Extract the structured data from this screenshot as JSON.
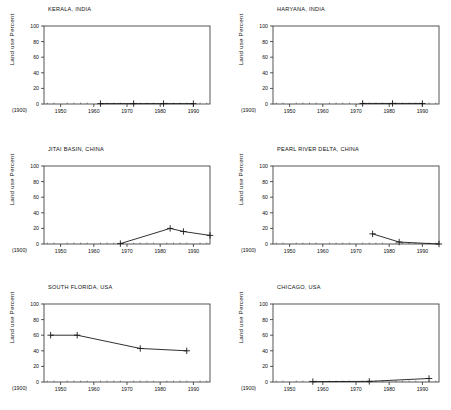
{
  "figure": {
    "layout": "2 columns x 3 rows of small-multiple line charts",
    "background_color": "#ffffff",
    "line_color": "#1a1a1a",
    "marker": "plus"
  },
  "axis": {
    "ylabel": "Land use Percent",
    "yticks": [
      "0",
      "20",
      "40",
      "60",
      "80",
      "100"
    ],
    "ytick_values": [
      0,
      20,
      40,
      60,
      80,
      100
    ],
    "xticks": [
      "1950",
      "1960",
      "1970",
      "1980",
      "1990"
    ],
    "xtick_values": [
      1950,
      1960,
      1970,
      1980,
      1990
    ],
    "origin_note": "(1900)",
    "xlim": [
      1945,
      1995
    ],
    "ylim": [
      0,
      100
    ]
  },
  "chart_data": [
    {
      "type": "line",
      "title": "KERALA, INDIA",
      "xlabel": "",
      "ylabel": "Land use Percent",
      "xlim": [
        1945,
        1995
      ],
      "ylim": [
        0,
        100
      ],
      "grid": false,
      "legend": "none",
      "x": [
        1962,
        1972,
        1981,
        1990
      ],
      "values": [
        0.5,
        0.5,
        0.5,
        0.5
      ]
    },
    {
      "type": "line",
      "title": "HARYANA, INDIA",
      "xlabel": "",
      "ylabel": "Land use Percent",
      "xlim": [
        1945,
        1995
      ],
      "ylim": [
        0,
        100
      ],
      "grid": false,
      "legend": "none",
      "x": [
        1972,
        1981,
        1990
      ],
      "values": [
        0.7,
        0.7,
        0.7
      ]
    },
    {
      "type": "line",
      "title": "JITAI BASIN, CHINA",
      "xlabel": "",
      "ylabel": "Land use Percent",
      "xlim": [
        1945,
        1995
      ],
      "ylim": [
        0,
        100
      ],
      "grid": false,
      "legend": "none",
      "x": [
        1968,
        1983,
        1987,
        1995
      ],
      "values": [
        0.5,
        20,
        16,
        11
      ]
    },
    {
      "type": "line",
      "title": "PEARL RIVER DELTA, CHINA",
      "xlabel": "",
      "ylabel": "Land use Percent",
      "xlim": [
        1945,
        1995
      ],
      "ylim": [
        0,
        100
      ],
      "grid": false,
      "legend": "none",
      "x": [
        1975,
        1983,
        1995
      ],
      "values": [
        13,
        2.5,
        0
      ]
    },
    {
      "type": "line",
      "title": "SOUTH FLORIDA, USA",
      "xlabel": "",
      "ylabel": "Land use Percent",
      "xlim": [
        1945,
        1995
      ],
      "ylim": [
        0,
        100
      ],
      "grid": false,
      "legend": "none",
      "x": [
        1947,
        1955,
        1974,
        1988
      ],
      "values": [
        60,
        60,
        43,
        40
      ]
    },
    {
      "type": "line",
      "title": "CHICAGO, USA",
      "xlabel": "",
      "ylabel": "Land use Percent",
      "xlim": [
        1945,
        1995
      ],
      "ylim": [
        0,
        100
      ],
      "grid": false,
      "legend": "none",
      "x": [
        1957,
        1974,
        1992
      ],
      "values": [
        0.5,
        0.8,
        4.5
      ]
    }
  ]
}
